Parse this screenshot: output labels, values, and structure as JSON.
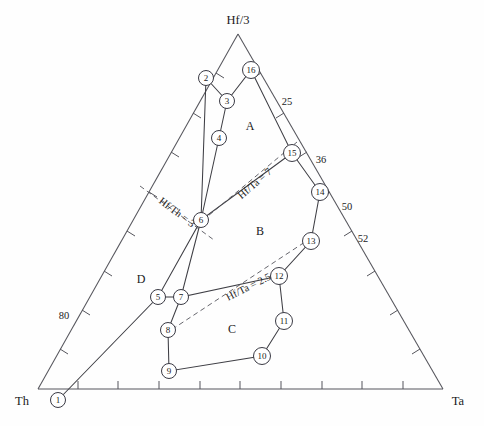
{
  "chart_data": {
    "type": "scatter",
    "title": "",
    "subtitle": "",
    "plot_kind": "ternary-discrimination-diagram",
    "vertices": [
      {
        "id": "th",
        "label": "Th",
        "x": 38,
        "y": 389,
        "label_x": 22,
        "label_y": 401
      },
      {
        "id": "hf3",
        "label": "Hf/3",
        "x": 238,
        "y": 34,
        "label_x": 238,
        "label_y": 24
      },
      {
        "id": "ta",
        "label": "Ta",
        "x": 443,
        "y": 389,
        "label_x": 456,
        "label_y": 401
      }
    ],
    "axis_tick_labels": [
      {
        "text": "80",
        "x": 64,
        "y": 316
      },
      {
        "text": "25",
        "x": 287,
        "y": 102
      },
      {
        "text": "36",
        "x": 321,
        "y": 160
      },
      {
        "text": "50",
        "x": 347,
        "y": 207
      },
      {
        "text": "52",
        "x": 363,
        "y": 239
      }
    ],
    "region_labels": [
      {
        "text": "A",
        "x": 250,
        "y": 126
      },
      {
        "text": "B",
        "x": 260,
        "y": 231
      },
      {
        "text": "C",
        "x": 232,
        "y": 329
      },
      {
        "text": "D",
        "x": 141,
        "y": 279
      }
    ],
    "ratio_lines": [
      {
        "text": "Hf/Th = 3",
        "x": 175,
        "y": 215,
        "rotate": 37
      },
      {
        "text": "Hf/Ta = 7",
        "x": 257,
        "y": 186,
        "rotate": -41
      },
      {
        "text": "Hf/Ta = 2.5",
        "x": 250,
        "y": 290,
        "rotate": -27
      }
    ],
    "points": [
      {
        "n": "1",
        "x": 58,
        "y": 400
      },
      {
        "n": "2",
        "x": 206,
        "y": 78
      },
      {
        "n": "3",
        "x": 227,
        "y": 101
      },
      {
        "n": "4",
        "x": 219,
        "y": 138
      },
      {
        "n": "5",
        "x": 158,
        "y": 297
      },
      {
        "n": "6",
        "x": 201,
        "y": 220
      },
      {
        "n": "7",
        "x": 181,
        "y": 297
      },
      {
        "n": "8",
        "x": 168,
        "y": 330
      },
      {
        "n": "9",
        "x": 169,
        "y": 371
      },
      {
        "n": "10",
        "x": 262,
        "y": 356
      },
      {
        "n": "11",
        "x": 284,
        "y": 321
      },
      {
        "n": "12",
        "x": 279,
        "y": 276
      },
      {
        "n": "13",
        "x": 311,
        "y": 241
      },
      {
        "n": "14",
        "x": 320,
        "y": 192
      },
      {
        "n": "15",
        "x": 292,
        "y": 153
      },
      {
        "n": "16",
        "x": 251,
        "y": 70
      }
    ],
    "field_boundaries": [
      {
        "name": "field-A",
        "polyline": "206,78 227,101 251,70 292,153 201,220 219,138 227,101"
      },
      {
        "name": "field-B",
        "polyline": "292,153 320,192 311,241 279,276 181,297 201,220"
      },
      {
        "name": "field-C",
        "polyline": "279,276 284,321 262,356 169,371 168,330 181,297"
      },
      {
        "name": "field-D-left",
        "polyline": "58,400 158,297 201,220 206,78"
      }
    ],
    "grid": false,
    "legend": "none"
  },
  "figure": {
    "caption": "",
    "marker_style": "circled-number"
  }
}
